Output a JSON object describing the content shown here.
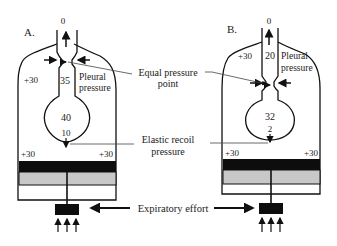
{
  "panels": {
    "a": {
      "label": "A.",
      "airway_opening": "0",
      "chamber_left": "+30",
      "airway_pressure": "35",
      "pleural_label_line1": "Pleural",
      "pleural_label_line2": "pressure",
      "alveolar_pressure": "40",
      "elastic_recoil": "10",
      "bottom_left": "+30",
      "bottom_right": "+30"
    },
    "b": {
      "label": "B.",
      "airway_opening": "0",
      "chamber_left": "+30",
      "airway_pressure": "20",
      "pleural_label_line1": "Pleural",
      "pleural_label_line2": "pressure",
      "alveolar_pressure": "32",
      "elastic_recoil": "2",
      "bottom_left": "+30",
      "bottom_right": "+30"
    }
  },
  "callouts": {
    "equal_pressure_line1": "Equal pressure",
    "equal_pressure_line2": "point",
    "elastic_recoil_line1": "Elastic recoil",
    "elastic_recoil_line2": "pressure",
    "expiratory_effort": "Expiratory effort"
  },
  "colors": {
    "ink": "#111111",
    "piston_dark": "#0d0d0d",
    "piston_gray": "#c8c8c8"
  }
}
